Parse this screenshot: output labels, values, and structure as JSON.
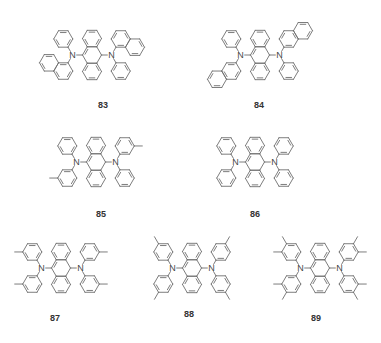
{
  "figure": {
    "caption": "",
    "colors": {
      "bond": "#6e6e6e",
      "label": "#333333",
      "background": "#ffffff"
    }
  },
  "molecules": [
    {
      "id": "83",
      "label": "83",
      "core": "anthracene",
      "center": [
        92,
        55
      ],
      "labelPos": [
        103,
        106
      ],
      "substituents": {
        "leftTop": "phenyl",
        "leftBottom": "1-naphthyl",
        "rightTop": "1-naphthyl",
        "rightBottom": "phenyl"
      }
    },
    {
      "id": "84",
      "label": "84",
      "core": "anthracene",
      "center": [
        260,
        55
      ],
      "labelPos": [
        259,
        106
      ],
      "substituents": {
        "leftTop": "phenyl",
        "leftBottom": "2-naphthyl",
        "rightTop": "2-naphthyl",
        "rightBottom": "phenyl"
      }
    },
    {
      "id": "85",
      "label": "85",
      "core": "anthracene",
      "center": [
        96,
        162
      ],
      "labelPos": [
        101,
        215
      ],
      "substituents": {
        "leftTop": "phenyl",
        "leftBottom": "3-methylphenyl",
        "rightTop": "3-methylphenyl",
        "rightBottom": "phenyl"
      }
    },
    {
      "id": "86",
      "label": "86",
      "core": "anthracene",
      "center": [
        255,
        162
      ],
      "labelPos": [
        255,
        215
      ],
      "substituents": {
        "leftTop": "phenyl",
        "leftBottom": "phenyl",
        "rightTop": "phenyl",
        "rightBottom": "phenyl"
      }
    },
    {
      "id": "87",
      "label": "87",
      "core": "anthracene",
      "center": [
        61,
        268
      ],
      "labelPos": [
        55,
        319
      ],
      "substituents": {
        "leftTop": "3-methylphenyl",
        "leftBottom": "3-methylphenyl",
        "rightTop": "3-methylphenyl",
        "rightBottom": "3-methylphenyl"
      }
    },
    {
      "id": "88",
      "label": "88",
      "core": "anthracene",
      "center": [
        192,
        268
      ],
      "labelPos": [
        189,
        315
      ],
      "substituents": {
        "leftTop": "4-methylphenyl",
        "leftBottom": "4-methylphenyl",
        "rightTop": "4-methylphenyl",
        "rightBottom": "4-methylphenyl"
      }
    },
    {
      "id": "89",
      "label": "89",
      "core": "anthracene",
      "center": [
        320,
        268
      ],
      "labelPos": [
        316,
        319
      ],
      "substituents": {
        "leftTop": "3,4-dimethylphenyl",
        "leftBottom": "3,4-dimethylphenyl",
        "rightTop": "3,4-dimethylphenyl",
        "rightBottom": "3,4-dimethylphenyl"
      }
    }
  ],
  "atoms": {
    "nitrogen": "N"
  }
}
